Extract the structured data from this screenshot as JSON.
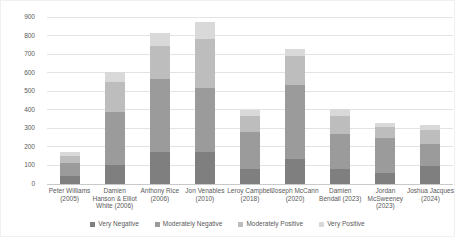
{
  "chart_data": {
    "type": "bar",
    "stacked": true,
    "title": "",
    "xlabel": "",
    "ylabel": "",
    "categories": [
      "Peter Williams (2005)",
      "Damien Hanson & Elliot White (2006)",
      "Anthony Rice (2006)",
      "Jon Venables (2010)",
      "Leroy Campbell (2018)",
      "Joseph McCann (2020)",
      "Damien Bendall (2023)",
      "Jordan McSweeney (2023)",
      "Joshua Jacques (2024)"
    ],
    "category_label_lines": [
      [
        "Peter Williams",
        "(2005)"
      ],
      [
        "Damien",
        "Hanson & Elliot",
        "White (2006)"
      ],
      [
        "Anthony Rice",
        "(2006)"
      ],
      [
        "Jon Venables",
        "(2010)"
      ],
      [
        "Leroy Campbell",
        "(2018)"
      ],
      [
        "Joseph McCann",
        "(2020)"
      ],
      [
        "Damien",
        "Bendall (2023)"
      ],
      [
        "Jordan",
        "McSweeney",
        "(2023)"
      ],
      [
        "Joshua Jacques",
        "(2024)"
      ]
    ],
    "series": [
      {
        "name": "Very Negative",
        "color": "#7f7f7f",
        "values": [
          45,
          100,
          170,
          175,
          80,
          135,
          80,
          60,
          95
        ]
      },
      {
        "name": "Moderately Negative",
        "color": "#9b9b9b",
        "values": [
          70,
          290,
          395,
          345,
          200,
          400,
          190,
          190,
          120
        ]
      },
      {
        "name": "Moderately Positive",
        "color": "#bdbdbd",
        "values": [
          35,
          160,
          180,
          260,
          85,
          155,
          95,
          55,
          75
        ]
      },
      {
        "name": "Very Positive",
        "color": "#d9d9d9",
        "values": [
          20,
          55,
          70,
          95,
          35,
          40,
          40,
          25,
          30
        ]
      }
    ],
    "totals": [
      170,
      605,
      815,
      875,
      400,
      730,
      405,
      330,
      320
    ],
    "ylim": [
      0,
      900
    ],
    "yticks": [
      0,
      100,
      200,
      300,
      400,
      500,
      600,
      700,
      800,
      900
    ],
    "grid": true,
    "legend_position": "bottom"
  },
  "style": {
    "background": "#ffffff",
    "grid_color": "#e3e3e3",
    "baseline_color": "#c9c9c9",
    "text_color": "#595959",
    "border_color": "#f0f0f0"
  }
}
